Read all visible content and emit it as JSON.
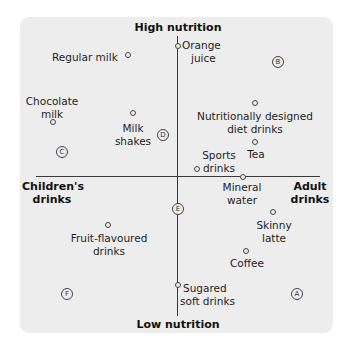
{
  "diagram": {
    "type": "perceptual_map",
    "axes": {
      "top": "High nutrition",
      "bottom": "Low nutrition",
      "left_line1": "Children's",
      "left_line2": "drinks",
      "right_line1": "Adult",
      "right_line2": "drinks"
    },
    "products": [
      {
        "name": "Regular milk",
        "line1": "Regular milk",
        "line2": ""
      },
      {
        "name": "Orange juice",
        "line1": "Orange",
        "line2": "juice"
      },
      {
        "name": "Chocolate milk",
        "line1": "Chocolate",
        "line2": "milk"
      },
      {
        "name": "Milk shakes",
        "line1": "Milk",
        "line2": "shakes"
      },
      {
        "name": "Nutritionally designed diet drinks",
        "line1": "Nutritionally designed",
        "line2": "diet drinks"
      },
      {
        "name": "Tea",
        "line1": "Tea",
        "line2": ""
      },
      {
        "name": "Sports drinks",
        "line1": "Sports",
        "line2": "drinks"
      },
      {
        "name": "Mineral water",
        "line1": "Mineral",
        "line2": "water"
      },
      {
        "name": "Fruit-flavoured drinks",
        "line1": "Fruit-flavoured",
        "line2": "drinks"
      },
      {
        "name": "Skinny latte",
        "line1": "Skinny",
        "line2": "latte"
      },
      {
        "name": "Coffee",
        "line1": "Coffee",
        "line2": ""
      },
      {
        "name": "Sugared soft drinks",
        "line1": "Sugared",
        "line2": "soft drinks"
      }
    ],
    "segments": [
      "A",
      "B",
      "C",
      "D",
      "E",
      "F"
    ]
  }
}
